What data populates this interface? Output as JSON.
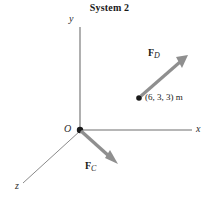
{
  "figure": {
    "title": "System 2",
    "background_color": "#ffffff",
    "axis_color": "#6e6e6e",
    "arrow_color": "#8a8a8a",
    "text_color": "#1a1a1a"
  },
  "axes": [
    {
      "name": "y",
      "label": "y",
      "direction": "up"
    },
    {
      "name": "x",
      "label": "x",
      "direction": "right"
    },
    {
      "name": "z",
      "label": "z",
      "direction": "down-left"
    }
  ],
  "origin": {
    "label": "O",
    "marker": "filled-dot"
  },
  "forces": [
    {
      "name": "F_C",
      "bold_symbol": "F",
      "subscript": "C",
      "direction": "down-right",
      "origin_at": "O"
    },
    {
      "name": "F_D",
      "bold_symbol": "F",
      "subscript": "D",
      "direction": "up-right",
      "origin_at": "point-6-3-3"
    }
  ],
  "points": [
    {
      "name": "point-6-3-3",
      "label": "(6, 3, 3) m",
      "marker": "filled-dot"
    }
  ]
}
